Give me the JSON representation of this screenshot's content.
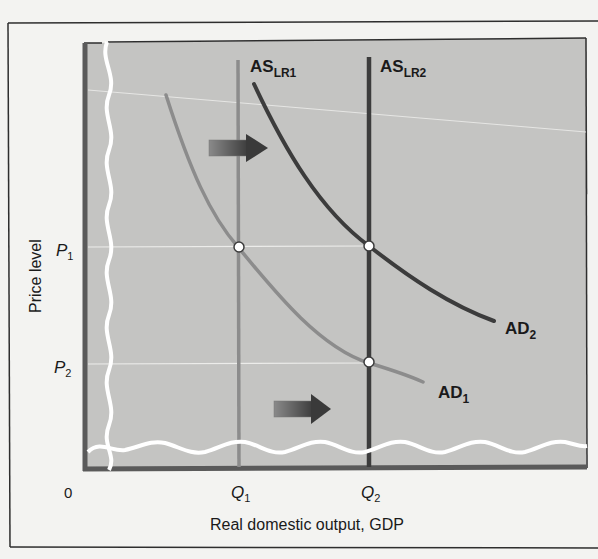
{
  "diagram": {
    "type": "economic-graph",
    "y_axis_label": "Price level",
    "x_axis_label": "Real domestic output, GDP",
    "origin_label": "0",
    "price_ticks": [
      {
        "base": "P",
        "sub": "1"
      },
      {
        "base": "P",
        "sub": "2"
      }
    ],
    "quantity_ticks": [
      {
        "base": "Q",
        "sub": "1"
      },
      {
        "base": "Q",
        "sub": "2"
      }
    ],
    "curves": {
      "as_lr1": {
        "base": "AS",
        "sub": "LR1",
        "color": "#8c8c8c"
      },
      "as_lr2": {
        "base": "AS",
        "sub": "LR2",
        "color": "#3c3c3c"
      },
      "ad1": {
        "base": "AD",
        "sub": "1",
        "color": "#8c8c8c"
      },
      "ad2": {
        "base": "AD",
        "sub": "2",
        "color": "#3c3c3c"
      }
    },
    "arrows": [
      {
        "name": "upper-shift-arrow",
        "direction": "right"
      },
      {
        "name": "lower-shift-arrow",
        "direction": "right"
      }
    ],
    "equilibrium_points": [
      {
        "label": "P1-Q1",
        "on": [
          "AD1",
          "AS_LR1"
        ]
      },
      {
        "label": "P1-Q2",
        "on": [
          "AD2",
          "AS_LR2"
        ]
      },
      {
        "label": "P2-Q2",
        "on": [
          "AD1",
          "AS_LR2"
        ]
      }
    ],
    "colors": {
      "plot_background": "#c4c4c2",
      "page_background": "#f3f3f1",
      "frame": "#2e2e2e",
      "axis": "#5a5a5a",
      "break_line": "#ffffff"
    }
  }
}
